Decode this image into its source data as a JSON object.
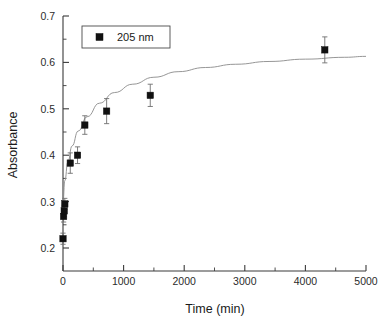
{
  "chart_data": {
    "type": "scatter",
    "title": "",
    "xlabel": "Time (min)",
    "ylabel": "Absorbance",
    "xlim": [
      0,
      5000
    ],
    "ylim": [
      0.2,
      0.7
    ],
    "xticks": [
      0,
      1000,
      2000,
      3000,
      4000,
      5000
    ],
    "xtick_labels": [
      "0",
      "1000",
      "2000",
      "3000",
      "4000",
      "5000"
    ],
    "yticks": [
      0.2,
      0.3,
      0.4,
      0.5,
      0.6,
      0.7
    ],
    "ytick_labels": [
      "0.2",
      "0.3",
      "0.4",
      "0.5",
      "0.6",
      "0.7"
    ],
    "x_minor_interval": 500,
    "y_minor_interval": 0.05,
    "grid": false,
    "legend_position": "top-left",
    "series": [
      {
        "name": "205 nm",
        "marker": "filled-square",
        "color": "#111111",
        "x": [
          0,
          10,
          20,
          30,
          120,
          240,
          360,
          720,
          1440,
          4320
        ],
        "y": [
          0.22,
          0.268,
          0.28,
          0.295,
          0.383,
          0.4,
          0.465,
          0.495,
          0.529,
          0.627
        ],
        "yerr": [
          0.012,
          0.012,
          0.012,
          0.012,
          0.022,
          0.018,
          0.02,
          0.027,
          0.024,
          0.028
        ]
      }
    ],
    "fit_curve": {
      "name": "fit",
      "color": "#8a8a8a",
      "x": [
        0,
        30,
        80,
        150,
        250,
        400,
        600,
        850,
        1150,
        1500,
        1900,
        2350,
        2850,
        3400,
        4000,
        4650,
        5000
      ],
      "y": [
        0.3,
        0.345,
        0.385,
        0.42,
        0.452,
        0.483,
        0.512,
        0.535,
        0.553,
        0.568,
        0.58,
        0.589,
        0.596,
        0.602,
        0.607,
        0.611,
        0.613
      ]
    }
  },
  "legend": {
    "entries": [
      {
        "label": "205 nm",
        "marker": "filled-square",
        "color": "#111111"
      }
    ]
  },
  "colors": {
    "marker": "#111111",
    "fit_line": "#8a8a8a",
    "axis": "#3a3a3a",
    "error_bar": "#6f6f6f",
    "background": "#ffffff"
  }
}
